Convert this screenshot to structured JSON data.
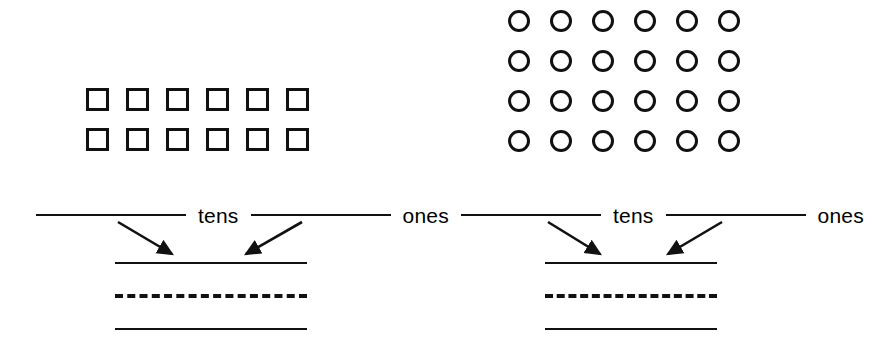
{
  "worksheet": {
    "background_color": "#ffffff",
    "ink_color": "#111111"
  },
  "exercises": [
    {
      "id": "exercise-squares",
      "manipulative": {
        "shape": "square",
        "rows": 2,
        "columns": 6,
        "total": 12
      },
      "place_value": {
        "tens_label": "tens",
        "ones_label": "ones",
        "tens_answer": "",
        "ones_answer": ""
      },
      "arrows": 2,
      "writing_guide": {
        "top_line": "solid",
        "middle_line": "dashed",
        "bottom_line": "solid",
        "answer": ""
      }
    },
    {
      "id": "exercise-circles",
      "manipulative": {
        "shape": "circle",
        "rows": 4,
        "columns": 6,
        "total": 24
      },
      "place_value": {
        "tens_label": "tens",
        "ones_label": "ones",
        "tens_answer": "",
        "ones_answer": ""
      },
      "arrows": 2,
      "writing_guide": {
        "top_line": "solid",
        "middle_line": "dashed",
        "bottom_line": "solid",
        "answer": ""
      }
    }
  ]
}
